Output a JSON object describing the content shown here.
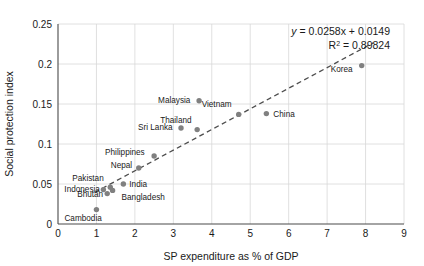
{
  "chart_data": {
    "type": "scatter",
    "title": "",
    "xlabel": "SP expenditure as % of GDP",
    "ylabel": "Social protection index",
    "xlim": [
      0,
      9
    ],
    "ylim": [
      0,
      0.25
    ],
    "xticks": [
      "0",
      "1",
      "2",
      "3",
      "4",
      "5",
      "6",
      "7",
      "8",
      "9"
    ],
    "yticks": [
      "0",
      "0.05",
      "0.1",
      "0.15",
      "0.2",
      "0.25"
    ],
    "grid": true,
    "legend": "none",
    "marker_color": "#808080",
    "trendline_color": "#4d4d4d",
    "annotations": {
      "equation_y": "y",
      "equation_rest": " = 0.0258x + 0.0149",
      "r_squared_prefix": "R",
      "r_squared_sup": "2",
      "r_squared_rest": " = 0.89824"
    },
    "trendline": {
      "slope": 0.0258,
      "intercept": 0.0149,
      "r_squared": 0.89824,
      "x_start": 0.95,
      "x_end": 8.2,
      "style": "dashed"
    },
    "points": [
      {
        "label": "Cambodia",
        "x": 1.0,
        "y": 0.018,
        "label_dx": -32,
        "label_dy": 11
      },
      {
        "label": "Bhutan",
        "x": 1.28,
        "y": 0.038,
        "label_dx": -30,
        "label_dy": 3
      },
      {
        "label": "Indonesia",
        "x": 1.18,
        "y": 0.043,
        "label_dx": -39,
        "label_dy": 2
      },
      {
        "label": "Pakistan",
        "x": 1.36,
        "y": 0.046,
        "label_dx": -38,
        "label_dy": -6
      },
      {
        "label": "Bangladesh",
        "x": 1.42,
        "y": 0.042,
        "label_dx": 9,
        "label_dy": 10
      },
      {
        "label": "India",
        "x": 1.7,
        "y": 0.05,
        "label_dx": 6,
        "label_dy": 3
      },
      {
        "label": "Nepal",
        "x": 2.1,
        "y": 0.07,
        "label_dx": -28,
        "label_dy": 0
      },
      {
        "label": "Philippines",
        "x": 2.5,
        "y": 0.085,
        "label_dx": -49,
        "label_dy": -1
      },
      {
        "label": "Sri Lanka",
        "x": 3.2,
        "y": 0.12,
        "label_dx": -43,
        "label_dy": 2
      },
      {
        "label": "Thailand",
        "x": 3.62,
        "y": 0.118,
        "label_dx": -37,
        "label_dy": -7
      },
      {
        "label": "Malaysia",
        "x": 3.67,
        "y": 0.154,
        "label_dx": -41,
        "label_dy": 2
      },
      {
        "label": "Vietnam",
        "x": 4.7,
        "y": 0.137,
        "label_dx": -37,
        "label_dy": -7
      },
      {
        "label": "China",
        "x": 5.42,
        "y": 0.138,
        "label_dx": 7,
        "label_dy": 3
      },
      {
        "label": "Korea",
        "x": 7.9,
        "y": 0.198,
        "label_dx": -31,
        "label_dy": 6
      }
    ]
  }
}
